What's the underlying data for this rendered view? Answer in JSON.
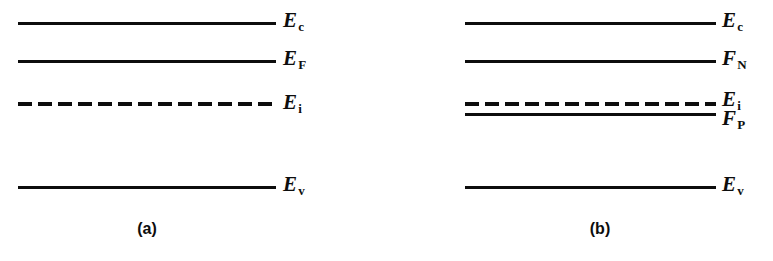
{
  "figure": {
    "type": "energy-band-diagram",
    "width": 773,
    "height": 261,
    "background_color": "#ffffff",
    "line_color": "#0d0d0d",
    "text_color": "#0d0d0d"
  },
  "panels": [
    {
      "id": "a",
      "caption": "(a)",
      "caption_x": 147,
      "caption_y": 221,
      "line_start_x": 18,
      "line_end_x": 276,
      "label_x": 283,
      "levels": [
        {
          "name": "conduction-band-edge",
          "symbol": "E",
          "subscript": "c",
          "style": "solid",
          "y": 22,
          "label_y": 10
        },
        {
          "name": "fermi-level",
          "symbol": "E",
          "subscript": "F",
          "style": "solid",
          "y": 60,
          "label_y": 48
        },
        {
          "name": "intrinsic-level",
          "symbol": "E",
          "subscript": "i",
          "style": "dashed",
          "y": 104,
          "label_y": 92
        },
        {
          "name": "valence-band-edge",
          "symbol": "E",
          "subscript": "v",
          "style": "solid",
          "y": 186,
          "label_y": 174
        }
      ]
    },
    {
      "id": "b",
      "caption": "(b)",
      "caption_x": 600,
      "caption_y": 221,
      "line_start_x": 465,
      "line_end_x": 716,
      "label_x": 722,
      "levels": [
        {
          "name": "conduction-band-edge",
          "symbol": "E",
          "subscript": "c",
          "style": "solid",
          "y": 22,
          "label_y": 10
        },
        {
          "name": "electron-quasi-fermi-level",
          "symbol": "F",
          "subscript": "N",
          "style": "solid",
          "y": 60,
          "label_y": 48
        },
        {
          "name": "intrinsic-level",
          "symbol": "E",
          "subscript": "i",
          "style": "dashed",
          "y": 104,
          "label_y": 89
        },
        {
          "name": "hole-quasi-fermi-level",
          "symbol": "F",
          "subscript": "P",
          "style": "solid",
          "y": 113,
          "label_y": 108
        },
        {
          "name": "valence-band-edge",
          "symbol": "E",
          "subscript": "v",
          "style": "solid",
          "y": 186,
          "label_y": 174
        }
      ]
    }
  ],
  "chart_data": {
    "type": "diagram",
    "title": "",
    "panels": [
      {
        "label": "(a)",
        "levels": [
          {
            "label": "Ec",
            "display": "E_c",
            "style": "solid",
            "y_px": 22
          },
          {
            "label": "EF",
            "display": "E_F",
            "style": "solid",
            "y_px": 60
          },
          {
            "label": "Ei",
            "display": "E_i",
            "style": "dashed",
            "y_px": 104
          },
          {
            "label": "Ev",
            "display": "E_v",
            "style": "solid",
            "y_px": 186
          }
        ]
      },
      {
        "label": "(b)",
        "levels": [
          {
            "label": "Ec",
            "display": "E_c",
            "style": "solid",
            "y_px": 22
          },
          {
            "label": "FN",
            "display": "F_N",
            "style": "solid",
            "y_px": 60
          },
          {
            "label": "Ei",
            "display": "E_i",
            "style": "dashed",
            "y_px": 104
          },
          {
            "label": "FP",
            "display": "F_P",
            "style": "solid",
            "y_px": 113
          },
          {
            "label": "Ev",
            "display": "E_v",
            "style": "solid",
            "y_px": 186
          }
        ]
      }
    ]
  }
}
